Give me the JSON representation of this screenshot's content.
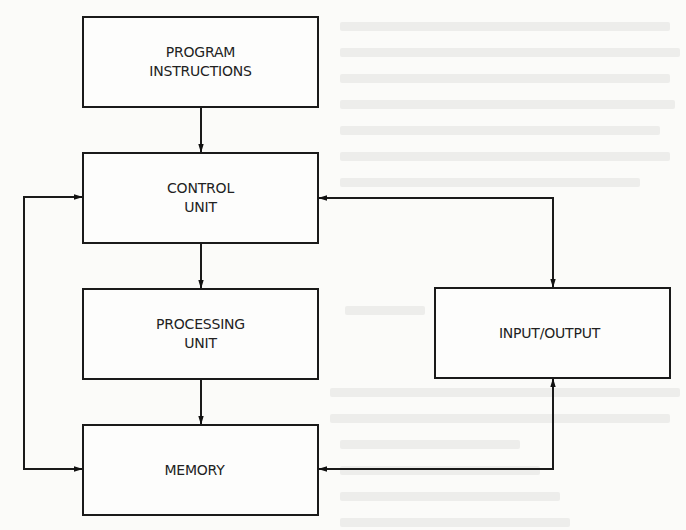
{
  "diagram": {
    "type": "block-diagram",
    "boxes": {
      "program_instructions": {
        "lines": [
          "PROGRAM",
          "INSTRUCTIONS"
        ]
      },
      "control_unit": {
        "lines": [
          "CONTROL",
          "UNIT"
        ]
      },
      "processing_unit": {
        "lines": [
          "PROCESSING",
          "UNIT"
        ]
      },
      "memory": {
        "lines": [
          "MEMORY"
        ]
      },
      "input_output": {
        "lines": [
          "INPUT/OUTPUT"
        ]
      }
    },
    "connections": [
      {
        "from": "program_instructions",
        "to": "control_unit",
        "direction": "one-way"
      },
      {
        "from": "control_unit",
        "to": "processing_unit",
        "direction": "one-way"
      },
      {
        "from": "processing_unit",
        "to": "memory",
        "direction": "one-way"
      },
      {
        "from": "control_unit",
        "to": "memory",
        "direction": "two-way",
        "route": "left"
      },
      {
        "from": "control_unit",
        "to": "input_output",
        "direction": "two-way",
        "route": "right"
      },
      {
        "from": "memory",
        "to": "input_output",
        "direction": "two-way",
        "route": "right"
      }
    ],
    "colors": {
      "stroke": "#1a1a1a",
      "text": "#222222",
      "background": "#fbfbf9"
    }
  }
}
